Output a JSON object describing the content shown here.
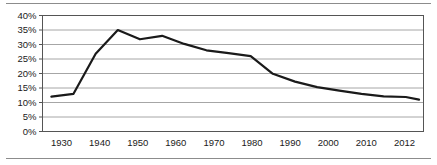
{
  "figure": {
    "background_color": "#ffffff",
    "rule_color": "#8c8c8c",
    "has_top_rule": true,
    "has_bottom_rule": true
  },
  "chart_data": {
    "type": "line",
    "title": "",
    "subtitle": "",
    "xlabel": "",
    "ylabel": "",
    "legend": [],
    "legend_position": "none",
    "grid": {
      "horizontal": true,
      "vertical": false,
      "color": "#a6a6a6"
    },
    "line_color": "#1a1a1a",
    "line_width": 2.2,
    "markers": false,
    "xlim": [
      1928,
      2014
    ],
    "ylim": [
      0,
      40
    ],
    "yticks": [
      0,
      5,
      10,
      15,
      20,
      25,
      30,
      35,
      40
    ],
    "ytick_labels": [
      "0%",
      "5%",
      "10%",
      "15%",
      "20%",
      "25%",
      "30%",
      "35%",
      "40%"
    ],
    "xticks": [
      1930,
      1940,
      1950,
      1960,
      1970,
      1980,
      1990,
      2000,
      2010,
      2012
    ],
    "xtick_labels": [
      "1930",
      "1940",
      "1950",
      "1960",
      "1970",
      "1980",
      "1990",
      "2000",
      "2010",
      "2012"
    ],
    "x": [
      1930,
      1935,
      1940,
      1945,
      1950,
      1955,
      1960,
      1965,
      1970,
      1975,
      1980,
      1985,
      1990,
      1995,
      2000,
      2005,
      2010,
      2013
    ],
    "values": [
      12.0,
      13.0,
      26.8,
      35.0,
      31.8,
      33.0,
      30.2,
      28.0,
      27.0,
      26.0,
      19.9,
      17.2,
      15.3,
      14.1,
      13.0,
      12.1,
      11.9,
      11.0
    ],
    "series": [
      {
        "name": "",
        "values": [
          12.0,
          13.0,
          26.8,
          35.0,
          31.8,
          33.0,
          30.2,
          28.0,
          27.0,
          26.0,
          19.9,
          17.2,
          15.3,
          14.1,
          13.0,
          12.1,
          11.9,
          11.0
        ]
      }
    ]
  }
}
